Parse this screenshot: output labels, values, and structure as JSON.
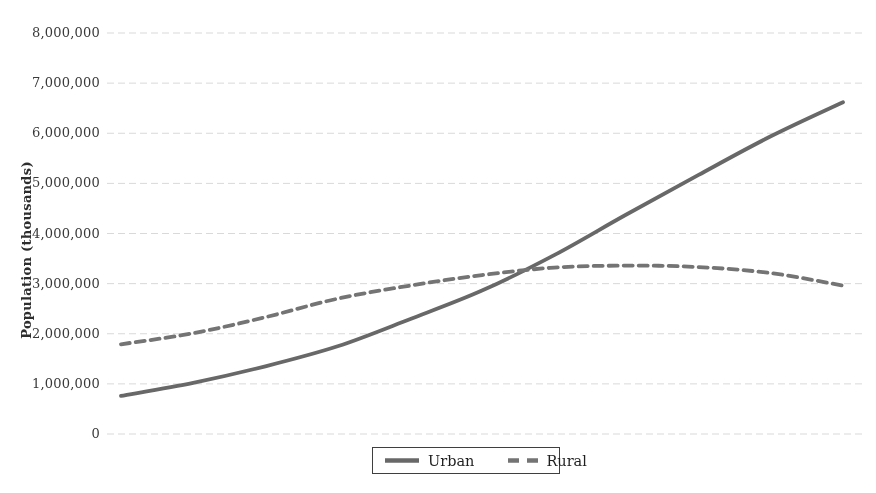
{
  "figure": {
    "background": "#ffffff"
  },
  "chart_data": {
    "type": "line",
    "title": "",
    "xlabel": "",
    "ylabel": "Population (thousands)",
    "x_axis_tick_labels_visible": false,
    "x": [
      0,
      1,
      2,
      3,
      4,
      5,
      6,
      7,
      8,
      9,
      10
    ],
    "series": [
      {
        "name": "Urban",
        "style": "solid",
        "color": "#686868",
        "values": [
          760000,
          1020000,
          1350000,
          1750000,
          2290000,
          2860000,
          3570000,
          4380000,
          5170000,
          5940000,
          6620000
        ]
      },
      {
        "name": "Rural",
        "style": "dashed",
        "color": "#747474",
        "values": [
          1790000,
          2010000,
          2330000,
          2700000,
          2960000,
          3170000,
          3320000,
          3360000,
          3330000,
          3210000,
          2960000
        ]
      }
    ],
    "ylim": [
      0,
      8000000
    ],
    "y_ticks": [
      0,
      1000000,
      2000000,
      3000000,
      4000000,
      5000000,
      6000000,
      7000000,
      8000000
    ],
    "y_tick_labels": [
      "0",
      "1,000,000",
      "2,000,000",
      "3,000,000",
      "4,000,000",
      "5,000,000",
      "6,000,000",
      "7,000,000",
      "8,000,000"
    ],
    "grid": true,
    "legend_position": "bottom-center"
  },
  "colors": {
    "grid": "#d9d9d9",
    "tick_text": "#3a3a3a",
    "axis_title_text": "#2e2e2e",
    "legend_border": "#3f3f3f",
    "legend_text": "#1f1f1f",
    "urban_line": "#686868",
    "rural_line": "#747474"
  }
}
